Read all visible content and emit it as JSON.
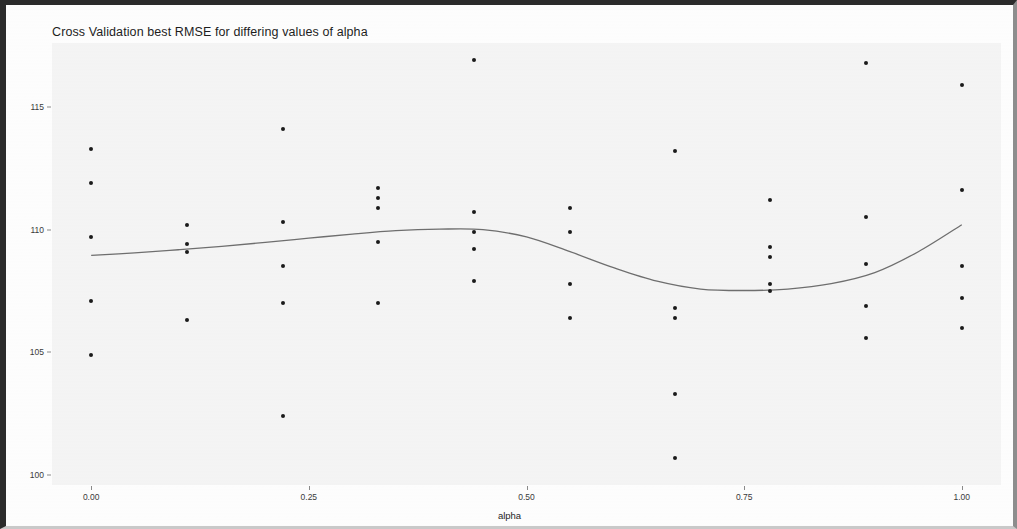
{
  "chart_data": {
    "type": "scatter",
    "title": "Cross Validation best RMSE for differing values of alpha",
    "xlabel": "alpha",
    "ylabel": "Root Mean Square Error",
    "xlim": [
      -0.045,
      1.045
    ],
    "ylim": [
      99.6,
      117.6
    ],
    "grid": false,
    "legend": null,
    "x_ticks": [
      0.0,
      0.25,
      0.5,
      0.75,
      1.0
    ],
    "x_tick_labels": [
      "0.00",
      "0.25",
      "0.50",
      "0.75",
      "1.00"
    ],
    "y_ticks": [
      100,
      105,
      110,
      115
    ],
    "y_tick_labels": [
      "100",
      "105",
      "110",
      "115"
    ],
    "point_color": "#1a1a1a",
    "line_color": "#6e6e6e",
    "panel_color": "#f4f4f4",
    "points": [
      {
        "x": 0.0,
        "y": 113.3
      },
      {
        "x": 0.0,
        "y": 111.9
      },
      {
        "x": 0.0,
        "y": 109.7
      },
      {
        "x": 0.0,
        "y": 107.1
      },
      {
        "x": 0.0,
        "y": 104.9
      },
      {
        "x": 0.11,
        "y": 110.2
      },
      {
        "x": 0.11,
        "y": 109.4
      },
      {
        "x": 0.11,
        "y": 109.1
      },
      {
        "x": 0.11,
        "y": 106.3
      },
      {
        "x": 0.22,
        "y": 114.1
      },
      {
        "x": 0.22,
        "y": 110.3
      },
      {
        "x": 0.22,
        "y": 108.5
      },
      {
        "x": 0.22,
        "y": 107.0
      },
      {
        "x": 0.22,
        "y": 102.4
      },
      {
        "x": 0.33,
        "y": 111.7
      },
      {
        "x": 0.33,
        "y": 111.3
      },
      {
        "x": 0.33,
        "y": 110.9
      },
      {
        "x": 0.33,
        "y": 109.5
      },
      {
        "x": 0.33,
        "y": 107.0
      },
      {
        "x": 0.44,
        "y": 116.9
      },
      {
        "x": 0.44,
        "y": 110.7
      },
      {
        "x": 0.44,
        "y": 109.9
      },
      {
        "x": 0.44,
        "y": 109.2
      },
      {
        "x": 0.44,
        "y": 107.9
      },
      {
        "x": 0.55,
        "y": 110.9
      },
      {
        "x": 0.55,
        "y": 109.9
      },
      {
        "x": 0.55,
        "y": 107.8
      },
      {
        "x": 0.55,
        "y": 106.4
      },
      {
        "x": 0.67,
        "y": 113.2
      },
      {
        "x": 0.67,
        "y": 106.8
      },
      {
        "x": 0.67,
        "y": 106.4
      },
      {
        "x": 0.67,
        "y": 103.3
      },
      {
        "x": 0.67,
        "y": 100.7
      },
      {
        "x": 0.78,
        "y": 111.2
      },
      {
        "x": 0.78,
        "y": 109.3
      },
      {
        "x": 0.78,
        "y": 108.9
      },
      {
        "x": 0.78,
        "y": 107.8
      },
      {
        "x": 0.78,
        "y": 107.5
      },
      {
        "x": 0.89,
        "y": 116.8
      },
      {
        "x": 0.89,
        "y": 110.5
      },
      {
        "x": 0.89,
        "y": 108.6
      },
      {
        "x": 0.89,
        "y": 106.9
      },
      {
        "x": 0.89,
        "y": 105.6
      },
      {
        "x": 1.0,
        "y": 115.9
      },
      {
        "x": 1.0,
        "y": 111.6
      },
      {
        "x": 1.0,
        "y": 108.5
      },
      {
        "x": 1.0,
        "y": 107.2
      },
      {
        "x": 1.0,
        "y": 106.0
      }
    ],
    "series": [
      {
        "name": "loess smooth",
        "type": "line",
        "x": [
          0.0,
          0.05,
          0.1,
          0.15,
          0.2,
          0.25,
          0.3,
          0.35,
          0.4,
          0.45,
          0.5,
          0.55,
          0.6,
          0.65,
          0.7,
          0.75,
          0.8,
          0.85,
          0.9,
          0.95,
          1.0
        ],
        "values": [
          108.95,
          109.05,
          109.18,
          109.32,
          109.48,
          109.65,
          109.82,
          109.96,
          110.02,
          110.0,
          109.7,
          109.1,
          108.45,
          107.9,
          107.58,
          107.52,
          107.58,
          107.8,
          108.25,
          109.1,
          110.2
        ]
      }
    ]
  }
}
